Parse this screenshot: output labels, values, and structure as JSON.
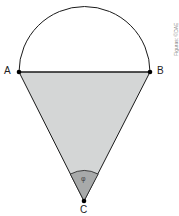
{
  "figure": {
    "points": {
      "A": {
        "label": "A",
        "x": 19,
        "y": 72
      },
      "B": {
        "label": "B",
        "x": 150,
        "y": 72
      },
      "C": {
        "label": "C",
        "x": 84,
        "y": 201
      }
    },
    "angle_label": "φ",
    "credit": "Figuras: ©DAE",
    "colors": {
      "triangle_fill": "#d4d6d6",
      "sector_fill": "#a8aaaa",
      "stroke": "#1a1a1a",
      "background": "#ffffff"
    }
  }
}
